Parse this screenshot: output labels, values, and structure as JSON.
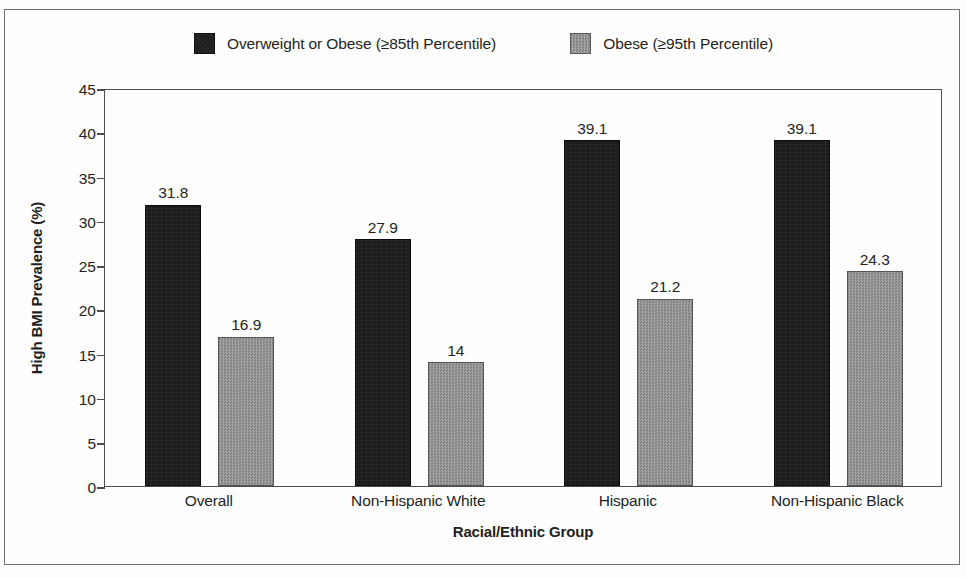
{
  "chart_data": {
    "type": "bar",
    "title": "",
    "xlabel": "Racial/Ethnic Group",
    "ylabel": "High BMI Prevalence (%)",
    "categories": [
      "Overall",
      "Non-Hispanic White",
      "Hispanic",
      "Non-Hispanic Black"
    ],
    "series": [
      {
        "name": "Overweight or Obese (≥85th Percentile)",
        "color": "#1c1c1c",
        "values": [
          31.8,
          27.9,
          39.1,
          39.1
        ],
        "labels": [
          "31.8",
          "27.9",
          "39.1",
          "39.1"
        ]
      },
      {
        "name": "Obese (≥95th Percentile)",
        "color": "#8d8d8d",
        "values": [
          16.9,
          14,
          21.2,
          24.3
        ],
        "labels": [
          "16.9",
          "14",
          "21.2",
          "24.3"
        ]
      }
    ],
    "ylim": [
      0,
      45
    ],
    "yticks": [
      0,
      5,
      10,
      15,
      20,
      25,
      30,
      35,
      40,
      45
    ],
    "ytick_labels": [
      "0",
      "5",
      "10",
      "15",
      "20",
      "25",
      "30",
      "35",
      "40",
      "45"
    ],
    "grid": false,
    "legend_position": "top-center"
  }
}
